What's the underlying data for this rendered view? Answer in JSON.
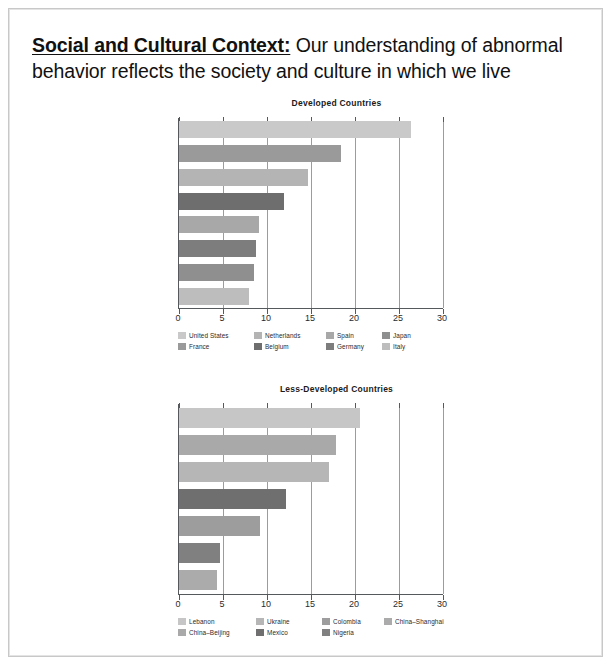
{
  "heading": {
    "lead": "Social and Cultural Context:",
    "rest": " Our understanding of abnormal behavior reflects the society and culture in which we live"
  },
  "chart_data": [
    {
      "type": "bar",
      "orientation": "horizontal",
      "title": "Developed Countries",
      "xlabel": "",
      "ylabel": "",
      "xlim": [
        0,
        30
      ],
      "xticks": [
        "0",
        "5",
        "10",
        "15",
        "20",
        "25",
        "30"
      ],
      "grid": true,
      "legend_position": "bottom",
      "categories": [
        "United States",
        "France",
        "Netherlands",
        "Belgium",
        "Spain",
        "Germany",
        "Japan",
        "Italy"
      ],
      "values": [
        26.4,
        18.4,
        14.7,
        11.9,
        9.1,
        8.8,
        8.5,
        7.9
      ],
      "colors": [
        "#c9c9c9",
        "#9a9a9a",
        "#b4b4b4",
        "#6e6e6e",
        "#a8a8a8",
        "#7d7d7d",
        "#8f8f8f",
        "#bdbdbd"
      ],
      "bars": [
        {
          "label": "United States",
          "value": 26.4,
          "color": "#c9c9c9"
        },
        {
          "label": "France",
          "value": 18.4,
          "color": "#9a9a9a"
        },
        {
          "label": "Netherlands",
          "value": 14.7,
          "color": "#b4b4b4"
        },
        {
          "label": "Belgium",
          "value": 11.9,
          "color": "#6e6e6e"
        },
        {
          "label": "Spain",
          "value": 9.1,
          "color": "#a8a8a8"
        },
        {
          "label": "Germany",
          "value": 8.8,
          "color": "#7d7d7d"
        },
        {
          "label": "Japan",
          "value": 8.5,
          "color": "#8f8f8f"
        },
        {
          "label": "Italy",
          "value": 7.9,
          "color": "#bdbdbd"
        }
      ],
      "legend": [
        [
          {
            "label": "United States",
            "color": "#c9c9c9"
          },
          {
            "label": "Netherlands",
            "color": "#b4b4b4"
          },
          {
            "label": "Spain",
            "color": "#a8a8a8"
          },
          {
            "label": "Japan",
            "color": "#8f8f8f"
          }
        ],
        [
          {
            "label": "France",
            "color": "#9a9a9a"
          },
          {
            "label": "Belgium",
            "color": "#6e6e6e"
          },
          {
            "label": "Germany",
            "color": "#7d7d7d"
          },
          {
            "label": "Italy",
            "color": "#bdbdbd"
          }
        ]
      ]
    },
    {
      "type": "bar",
      "orientation": "horizontal",
      "title": "Less-Developed Countries",
      "xlabel": "",
      "ylabel": "",
      "xlim": [
        0,
        30
      ],
      "xticks": [
        "0",
        "5",
        "10",
        "15",
        "20",
        "25",
        "30"
      ],
      "grid": true,
      "legend_position": "bottom",
      "categories": [
        "Lebanon",
        "China-Beijing",
        "Ukraine",
        "Mexico",
        "Colombia",
        "Nigeria",
        "China-Shanghai"
      ],
      "values": [
        20.6,
        17.8,
        17.0,
        12.2,
        9.2,
        4.7,
        4.3
      ],
      "colors": [
        "#c6c6c6",
        "#a9a9a9",
        "#b6b6b6",
        "#6f6f6f",
        "#9d9d9d",
        "#808080",
        "#ababab"
      ],
      "bars": [
        {
          "label": "Lebanon",
          "value": 20.6,
          "color": "#c6c6c6"
        },
        {
          "label": "China-Beijing",
          "value": 17.8,
          "color": "#a9a9a9"
        },
        {
          "label": "Ukraine",
          "value": 17.0,
          "color": "#b6b6b6"
        },
        {
          "label": "Mexico",
          "value": 12.2,
          "color": "#6f6f6f"
        },
        {
          "label": "Colombia",
          "value": 9.2,
          "color": "#9d9d9d"
        },
        {
          "label": "Nigeria",
          "value": 4.7,
          "color": "#808080"
        },
        {
          "label": "China-Shanghai",
          "value": 4.3,
          "color": "#ababab"
        }
      ],
      "legend": [
        [
          {
            "label": "Lebanon",
            "color": "#c6c6c6"
          },
          {
            "label": "Ukraine",
            "color": "#b6b6b6"
          },
          {
            "label": "Colombia",
            "color": "#9d9d9d"
          },
          {
            "label": "China–Shanghai",
            "color": "#ababab"
          }
        ],
        [
          {
            "label": "China–Beijing",
            "color": "#a9a9a9"
          },
          {
            "label": "Mexico",
            "color": "#6f6f6f"
          },
          {
            "label": "Nigeria",
            "color": "#808080"
          }
        ]
      ]
    }
  ]
}
